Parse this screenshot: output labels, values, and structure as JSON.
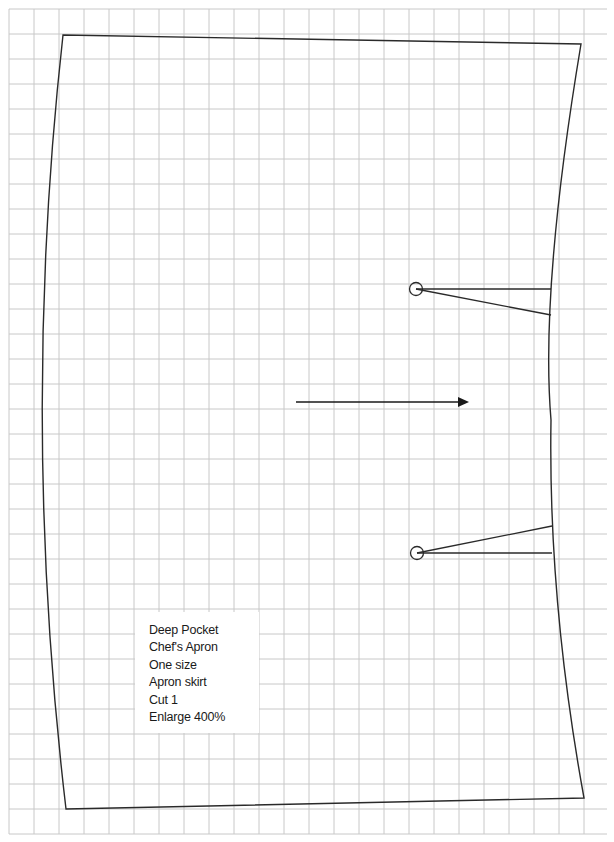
{
  "pattern": {
    "title_lines": [
      "Deep Pocket",
      "Chef's Apron",
      "One size",
      "Apron skirt",
      "Cut 1",
      "Enlarge 400%"
    ],
    "grain_arrow": {
      "direction": "right"
    },
    "notches": [
      {
        "position": "upper",
        "marker": "circle"
      },
      {
        "position": "lower",
        "marker": "circle"
      }
    ]
  },
  "grid": {
    "spacing_px": 25,
    "line_color": "#c8c8c8",
    "outline_color": "#2a2a2a"
  }
}
